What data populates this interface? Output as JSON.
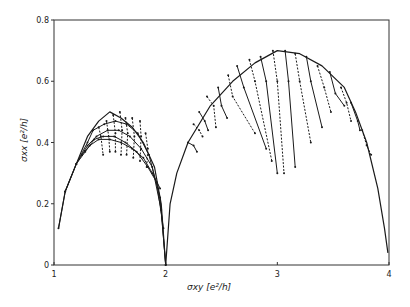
{
  "chart_data": {
    "type": "line",
    "title": "",
    "xlabel": "σxy [e²/h]",
    "ylabel": "σxx [e²/h]",
    "xlim": [
      1,
      4
    ],
    "ylim": [
      0,
      0.8
    ],
    "xticks": [
      1,
      2,
      3,
      4
    ],
    "xtick_labels": [
      "1",
      "2",
      "3",
      "4"
    ],
    "yticks": [
      0,
      0.2,
      0.4,
      0.6,
      0.8
    ],
    "ytick_labels": [
      "0",
      "0.2",
      "0.4",
      "0.6",
      "0.8"
    ],
    "grid": false,
    "legend": null,
    "colors": {
      "line": "#1a1a1a",
      "frame": "#333333",
      "background": "#ffffff"
    },
    "semicircle_envelopes": [
      {
        "name": "arc 1-2",
        "x": [
          1.04,
          1.1,
          1.2,
          1.3,
          1.4,
          1.5,
          1.6,
          1.7,
          1.8,
          1.9,
          1.96,
          2.0
        ],
        "y": [
          0.12,
          0.24,
          0.33,
          0.42,
          0.47,
          0.5,
          0.48,
          0.45,
          0.4,
          0.32,
          0.2,
          0.0
        ]
      },
      {
        "name": "arc 2-3-4",
        "x": [
          2.0,
          2.04,
          2.1,
          2.2,
          2.4,
          2.6,
          2.8,
          3.0,
          3.2,
          3.4,
          3.6,
          3.7,
          3.8,
          3.9,
          3.96,
          3.99
        ],
        "y": [
          0.0,
          0.2,
          0.3,
          0.4,
          0.52,
          0.6,
          0.66,
          0.7,
          0.69,
          0.65,
          0.58,
          0.5,
          0.4,
          0.25,
          0.12,
          0.04
        ]
      }
    ],
    "series": [
      {
        "name": "T1",
        "x": [
          1.04,
          1.1,
          1.2,
          1.3,
          1.35,
          1.45,
          1.55,
          1.65,
          1.75,
          1.85,
          1.95,
          2.0
        ],
        "y": [
          0.12,
          0.24,
          0.33,
          0.4,
          0.44,
          0.46,
          0.47,
          0.46,
          0.43,
          0.36,
          0.22,
          0.0
        ]
      },
      {
        "name": "T2",
        "x": [
          1.1,
          1.2,
          1.3,
          1.38,
          1.48,
          1.58,
          1.68,
          1.78,
          1.88,
          1.96,
          2.0
        ],
        "y": [
          0.24,
          0.33,
          0.39,
          0.42,
          0.44,
          0.44,
          0.42,
          0.38,
          0.32,
          0.18,
          0.0
        ]
      },
      {
        "name": "T3",
        "x": [
          1.2,
          1.28,
          1.36,
          1.44,
          1.54,
          1.64,
          1.74,
          1.84,
          1.92,
          1.98
        ],
        "y": [
          0.33,
          0.37,
          0.41,
          0.42,
          0.42,
          0.4,
          0.37,
          0.32,
          0.27,
          0.12
        ]
      },
      {
        "name": "T4",
        "x": [
          1.25,
          1.32,
          1.4,
          1.5,
          1.6,
          1.7,
          1.8,
          1.88,
          1.95
        ],
        "y": [
          0.36,
          0.39,
          0.41,
          0.41,
          0.4,
          0.38,
          0.35,
          0.3,
          0.25
        ]
      }
    ],
    "transition_traces_arc1": [
      {
        "x": [
          1.4,
          1.42,
          1.44
        ],
        "y": [
          0.45,
          0.42,
          0.36
        ]
      },
      {
        "x": [
          1.47,
          1.49,
          1.5
        ],
        "y": [
          0.47,
          0.42,
          0.37
        ]
      },
      {
        "x": [
          1.53,
          1.55,
          1.55
        ],
        "y": [
          0.49,
          0.43,
          0.37
        ]
      },
      {
        "x": [
          1.59,
          1.61,
          1.6
        ],
        "y": [
          0.5,
          0.44,
          0.36
        ]
      },
      {
        "x": [
          1.64,
          1.66,
          1.65
        ],
        "y": [
          0.48,
          0.43,
          0.36
        ]
      },
      {
        "x": [
          1.7,
          1.72,
          1.71
        ],
        "y": [
          0.48,
          0.42,
          0.35
        ]
      },
      {
        "x": [
          1.77,
          1.78,
          1.77
        ],
        "y": [
          0.47,
          0.42,
          0.34
        ]
      },
      {
        "x": [
          1.82,
          1.84,
          1.83
        ],
        "y": [
          0.43,
          0.38,
          0.32
        ]
      }
    ],
    "transition_traces_arc2": [
      {
        "x": [
          2.2,
          2.25,
          2.28
        ],
        "y": [
          0.4,
          0.39,
          0.37
        ]
      },
      {
        "x": [
          2.25,
          2.3,
          2.33
        ],
        "y": [
          0.46,
          0.44,
          0.42
        ]
      },
      {
        "x": [
          2.3,
          2.35,
          2.38
        ],
        "y": [
          0.5,
          0.47,
          0.44
        ]
      },
      {
        "x": [
          2.37,
          2.43,
          2.45
        ],
        "y": [
          0.55,
          0.52,
          0.45
        ]
      },
      {
        "x": [
          2.47,
          2.5,
          2.55
        ],
        "y": [
          0.58,
          0.52,
          0.48
        ]
      },
      {
        "x": [
          2.56,
          2.6,
          2.8
        ],
        "y": [
          0.62,
          0.55,
          0.43
        ]
      },
      {
        "x": [
          2.64,
          2.7,
          2.9
        ],
        "y": [
          0.65,
          0.58,
          0.38
        ]
      },
      {
        "x": [
          2.75,
          2.8,
          2.95
        ],
        "y": [
          0.67,
          0.6,
          0.34
        ]
      },
      {
        "x": [
          2.85,
          2.9,
          3.0
        ],
        "y": [
          0.68,
          0.6,
          0.3
        ]
      },
      {
        "x": [
          2.96,
          3.0,
          3.06
        ],
        "y": [
          0.7,
          0.6,
          0.3
        ]
      },
      {
        "x": [
          3.07,
          3.1,
          3.16
        ],
        "y": [
          0.7,
          0.6,
          0.32
        ]
      },
      {
        "x": [
          3.16,
          3.2,
          3.3
        ],
        "y": [
          0.69,
          0.6,
          0.4
        ]
      },
      {
        "x": [
          3.26,
          3.3,
          3.4
        ],
        "y": [
          0.68,
          0.6,
          0.45
        ]
      },
      {
        "x": [
          3.36,
          3.42,
          3.48
        ],
        "y": [
          0.65,
          0.58,
          0.5
        ]
      },
      {
        "x": [
          3.47,
          3.52,
          3.6
        ],
        "y": [
          0.63,
          0.56,
          0.52
        ]
      },
      {
        "x": [
          3.57,
          3.62,
          3.66
        ],
        "y": [
          0.58,
          0.53,
          0.47
        ]
      },
      {
        "x": [
          3.66,
          3.72,
          3.74
        ],
        "y": [
          0.53,
          0.47,
          0.44
        ]
      },
      {
        "x": [
          3.76,
          3.8,
          3.84
        ],
        "y": [
          0.44,
          0.39,
          0.36
        ]
      }
    ]
  }
}
